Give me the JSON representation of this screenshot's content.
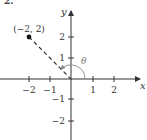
{
  "problem": {
    "number": "2."
  },
  "axes": {
    "x_label": "x",
    "y_label": "y"
  },
  "x_ticks": [
    "−2",
    "−1",
    "1",
    "2"
  ],
  "y_ticks": [
    "2",
    "1",
    "−1",
    "−2"
  ],
  "point": {
    "label": "(−2, 2)",
    "x": -2,
    "y": 2
  },
  "angle": {
    "label": "θ",
    "degrees": 135
  },
  "colors": {
    "axis": "#333333",
    "line": "#333333",
    "arc": "#888888"
  }
}
